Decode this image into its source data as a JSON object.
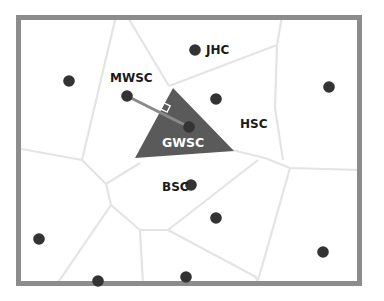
{
  "diagram": {
    "type": "voronoi",
    "colors": {
      "background": "#ffffff",
      "frame": "#8c8c8c",
      "cell_edges": "#e4e4e4",
      "site": "#333333",
      "highlight_cell": "#5a5a5a",
      "connector": "#8a8a8a",
      "label": "#1a1a1a",
      "highlight_label": "#ffffff"
    },
    "labels": {
      "jhc": "JHC",
      "mwsc": "MWSC",
      "hsc": "HSC",
      "gwsc": "GWSC",
      "bsc": "BSC"
    },
    "sites": [
      {
        "id": "s1",
        "x": 69,
        "y": 81
      },
      {
        "id": "mwsc",
        "x": 127,
        "y": 96
      },
      {
        "id": "jhc",
        "x": 195,
        "y": 50
      },
      {
        "id": "s4",
        "x": 216,
        "y": 99
      },
      {
        "id": "s5",
        "x": 329,
        "y": 87
      },
      {
        "id": "gwsc",
        "x": 189,
        "y": 127
      },
      {
        "id": "bsc",
        "x": 191,
        "y": 185
      },
      {
        "id": "s8",
        "x": 216,
        "y": 218
      },
      {
        "id": "s9",
        "x": 39,
        "y": 239
      },
      {
        "id": "s10",
        "x": 98,
        "y": 281
      },
      {
        "id": "s11",
        "x": 186,
        "y": 277
      },
      {
        "id": "s12",
        "x": 323,
        "y": 252
      }
    ]
  }
}
